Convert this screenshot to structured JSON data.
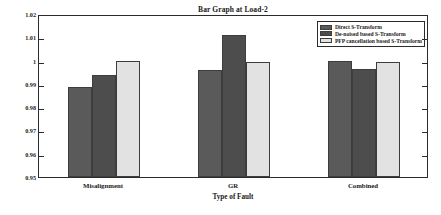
{
  "chart_data": {
    "type": "bar",
    "title": "Bar Graph at Load-2",
    "xlabel": "Type of Fault",
    "ylabel": "",
    "categories": [
      "Misalignment",
      "GR",
      "Combined"
    ],
    "series": [
      {
        "name": "Direct S-Transform",
        "color": "#5a5a5a",
        "values": [
          0.9885,
          0.9958,
          1.0
        ]
      },
      {
        "name": "De-noised based S-Transform",
        "color": "#4d4d4d",
        "values": [
          0.9938,
          1.0112,
          0.9963
        ]
      },
      {
        "name": "PFP cancellation based S-Transform",
        "color": "#e2e2e2",
        "values": [
          1.0,
          0.9996,
          0.9994
        ]
      }
    ],
    "ylim": [
      0.95,
      1.02
    ],
    "ytick_labels": [
      "1.02",
      "1.01",
      "1",
      "0.99",
      "0.98",
      "0.97",
      "0.96",
      "0.95"
    ],
    "ytick_values": [
      1.02,
      1.01,
      1.0,
      0.99,
      0.98,
      0.97,
      0.96,
      0.95
    ],
    "grid": false,
    "legend_position": "top-right"
  },
  "legend": {
    "entries": [
      "Direct S-Transform",
      "De-noised based S-Transform",
      "PFP cancellation based S-Transform"
    ]
  }
}
